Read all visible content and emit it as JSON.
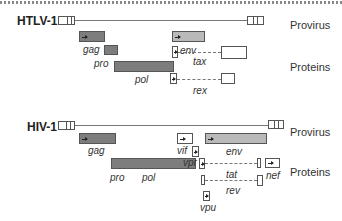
{
  "htlv": {
    "title": "HTLV-1",
    "provirus_label": "Provirus",
    "proteins_label": "Proteins",
    "genes": {
      "gag": "gag",
      "pro": "pro",
      "pol": "pol",
      "env": "env",
      "tax": "tax",
      "rex": "rex"
    }
  },
  "hiv": {
    "title": "HIV-1",
    "provirus_label": "Provirus",
    "proteins_label": "Proteins",
    "genes": {
      "gag": "gag",
      "pro": "pro",
      "pol": "pol",
      "vif": "vif",
      "vpr": "vpr",
      "env": "env",
      "tat": "tat",
      "nef": "nef",
      "rev": "rev",
      "vpu": "vpu"
    }
  },
  "colors": {
    "dark_gene": "#7d7d7d",
    "light_gene": "#b9b9b9",
    "outline": "#555555"
  }
}
